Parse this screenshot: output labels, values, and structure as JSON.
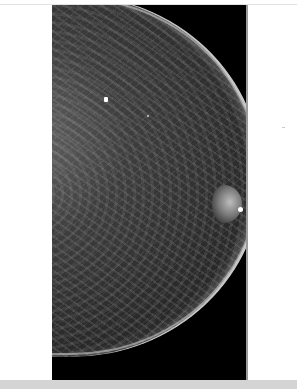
{
  "image": {
    "subject": "mammogram",
    "view": "craniocaudal",
    "background_color": "#ffffff",
    "film_color": "#000000",
    "footer_band_color": "#d4d4d4"
  },
  "annotations": {
    "marker": "skin-marker-dot",
    "calcifications": 2
  }
}
